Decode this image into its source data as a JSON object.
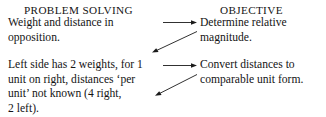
{
  "diagram": {
    "columns": {
      "left": {
        "heading": "PROBLEM SOLVING",
        "blocks": [
          {
            "lines": [
              "Weight and distance in",
              "opposition."
            ]
          },
          {
            "lines": [
              "Left side has 2 weights, for 1",
              "unit on right, distances ‘per",
              "unit’ not known (4 right,",
              "2 left)."
            ]
          }
        ]
      },
      "right": {
        "heading": "OBJECTIVE",
        "blocks": [
          {
            "lines": [
              "Determine relative",
              "magnitude."
            ]
          },
          {
            "lines": [
              "Convert distances to",
              "comparable unit form."
            ]
          }
        ]
      }
    },
    "connectors": [
      {
        "name": "arrow-straight-top",
        "style": "straight",
        "direction": "right"
      },
      {
        "name": "arrow-diagonal-top",
        "style": "diagonal",
        "direction": "down-left"
      },
      {
        "name": "arrow-straight-bottom",
        "style": "straight",
        "direction": "right"
      },
      {
        "name": "arrow-diagonal-bottom",
        "style": "diagonal",
        "direction": "down-left"
      }
    ],
    "colors": {
      "ink": "#1a1a1a",
      "background": "#ffffff"
    }
  }
}
